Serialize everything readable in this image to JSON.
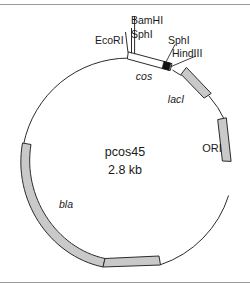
{
  "figure": {
    "kind": "plasmid-map",
    "plasmid_name": "pcos45",
    "plasmid_size": "2.8 kb"
  },
  "colors": {
    "background": "#ffffff",
    "line": "#2b2b2b",
    "gene_fill": "#c9c9c9",
    "cos_fill": "#ffffff",
    "cos_marker": "#111111",
    "rule": "#9a9a9a"
  },
  "center": {
    "name": "pcos45",
    "size": "2.8 kb"
  },
  "restriction_sites": [
    {
      "id": "ecori",
      "label": "EcoRI"
    },
    {
      "id": "bamhi",
      "label": "BamHI"
    },
    {
      "id": "sphi-1",
      "label": "SphI"
    },
    {
      "id": "sphi-2",
      "label": "SphI"
    },
    {
      "id": "hindiii",
      "label": "HindIII"
    }
  ],
  "features": [
    {
      "id": "cos",
      "label": "cos",
      "style": "open-box"
    },
    {
      "id": "laci",
      "label": "lacI",
      "style": "filled-arc"
    },
    {
      "id": "ori",
      "label": "ORI",
      "style": "filled-arc"
    },
    {
      "id": "bla",
      "label": "bla",
      "style": "filled-arc"
    }
  ],
  "labels": {
    "ecori": "EcoRI",
    "bamhi": "BamHI",
    "sphi_left": "SphI",
    "sphi_right": "SphI",
    "hindiii": "HindIII",
    "cos": "cos",
    "laci": "lacI",
    "ori": "ORI",
    "bla": "bla"
  }
}
